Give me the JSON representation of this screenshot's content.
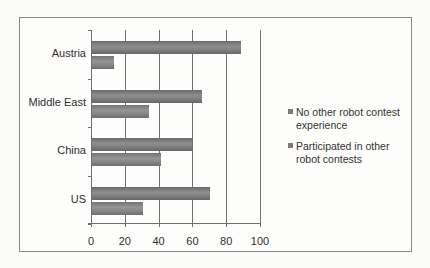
{
  "chart_data": {
    "type": "bar",
    "orientation": "horizontal",
    "title": "",
    "xlabel": "",
    "ylabel": "",
    "categories": [
      "Austria",
      "Middle East",
      "China",
      "US"
    ],
    "series": [
      {
        "name": "No other robot contest experience",
        "values": [
          88,
          65,
          59,
          70
        ],
        "color": "#7f7f7f"
      },
      {
        "name": "Participated in other robot contests",
        "values": [
          13,
          34,
          41,
          30
        ],
        "color": "#8a8a8a"
      }
    ],
    "xlim": [
      0,
      100
    ],
    "x_ticks": [
      "0",
      "20",
      "40",
      "60",
      "80",
      "100"
    ],
    "grid": {
      "vertical": true,
      "horizontal": false
    },
    "legend_position": "right"
  },
  "labels": {
    "categories": [
      "Austria",
      "Middle East",
      "China",
      "US"
    ],
    "x_ticks": [
      "0",
      "20",
      "40",
      "60",
      "80",
      "100"
    ],
    "legend": [
      "No other robot contest experience",
      "Participated in other robot contests"
    ]
  }
}
